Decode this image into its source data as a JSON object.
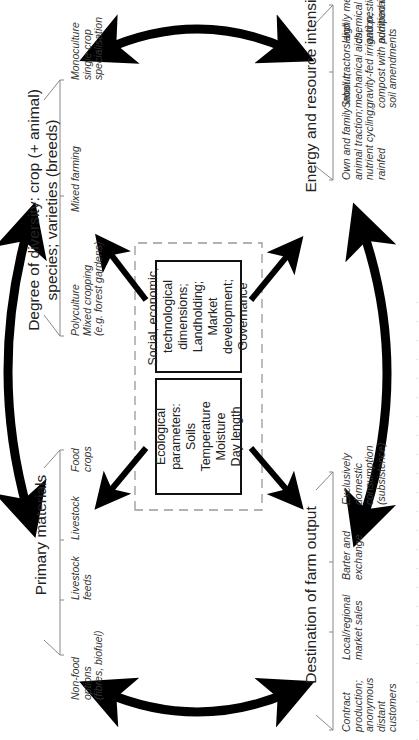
{
  "diagram": {
    "center": {
      "ecological_box": {
        "lines": [
          "Ecological parameters:",
          "Soils",
          "Temperature",
          "Moisture",
          "Day length"
        ]
      },
      "social_box": {
        "lines": [
          "Social, economic,",
          "technological",
          "dimensions;",
          "Landholding;",
          "Market development;",
          "Governance"
        ]
      }
    },
    "dimensions": {
      "diversity": {
        "title_lines": [
          "Degree of diversity: crop (+ animal)",
          "species; varieties (breeds)"
        ],
        "items": [
          {
            "lines": [
              "Polyculture",
              "Mixed cropping",
              "(e.g. forest gardens)"
            ]
          },
          {
            "lines": [
              "Mixed farming"
            ]
          },
          {
            "lines": [
              "Monoculture",
              "single crop",
              "specialisation"
            ]
          }
        ]
      },
      "energy": {
        "title": "Energy and resource intensity",
        "items": [
          {
            "lines": [
              "Own and family labour;",
              "animal traction;",
              "nutrient cycling;",
              "rainfed"
            ]
          },
          {
            "lines": [
              "Small tractors and",
              "mechanical aids;",
              "gravity-fed irrigation;",
              "compost with additional",
              "soil amendments"
            ]
          },
          {
            "lines": [
              "Highly mechanized;",
              "chemical fertilizers",
              "and pesticides;",
              "pumped irrigation"
            ]
          }
        ]
      },
      "primary_materials": {
        "title": "Primary materials",
        "items": [
          {
            "lines": [
              "Non-food",
              "options",
              "(fibres, biofuel)"
            ]
          },
          {
            "lines": [
              "Livestock",
              "feeds"
            ]
          },
          {
            "lines": [
              "Livestock"
            ]
          },
          {
            "lines": [
              "Food",
              "crops"
            ]
          }
        ]
      },
      "destination": {
        "title": "Destination of farm output",
        "items": [
          {
            "lines": [
              "Contract",
              "production;",
              "anonymous",
              "distant",
              "customers"
            ]
          },
          {
            "lines": [
              "Local/regional",
              "market sales"
            ]
          },
          {
            "lines": [
              "Barter and",
              "exchange"
            ]
          },
          {
            "lines": [
              "Exclusively",
              "domestic",
              "consumption",
              "(subsistence)"
            ]
          }
        ]
      }
    },
    "colors": {
      "arrow": "#000000",
      "text": "#222222",
      "dashed_border": "#999999",
      "bracket_line": "#888888"
    },
    "orientation": "rotated 90° counter-clockwise"
  }
}
